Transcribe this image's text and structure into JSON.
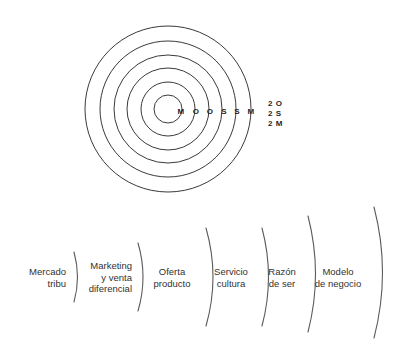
{
  "figure": {
    "background_color": "#ffffff",
    "stroke_color": "#3a3a3a",
    "text_color": "#33312f"
  },
  "rings": {
    "count": 6,
    "center": {
      "x": 168,
      "y": 109
    },
    "radii": [
      14,
      27,
      41,
      54,
      68,
      83
    ],
    "letters": [
      {
        "label": "M",
        "x": 181,
        "y": 111
      },
      {
        "label": "O",
        "x": 196,
        "y": 111
      },
      {
        "label": "O",
        "x": 210,
        "y": 111
      },
      {
        "label": "S",
        "x": 224,
        "y": 111
      },
      {
        "label": "S",
        "x": 237,
        "y": 111
      },
      {
        "label": "M",
        "x": 251,
        "y": 111
      }
    ]
  },
  "legend": {
    "x": 268,
    "y": 99,
    "lines": [
      "2 O",
      "2 S",
      "2 M"
    ]
  },
  "segments": [
    {
      "name": "mercado-tribu",
      "label": "Mercado\ntribu",
      "align": "right",
      "text_x": 8,
      "text_width": 58,
      "text_y": 277,
      "arc": {
        "x": 74,
        "y_top": 252,
        "y_bottom": 302,
        "bulge": 7
      }
    },
    {
      "name": "marketing-venta-diferencial",
      "label": "Marketing\ny venta\ndiferencial",
      "align": "right",
      "text_x": 74,
      "text_width": 58,
      "text_y": 277,
      "arc": {
        "x": 138,
        "y_top": 243,
        "y_bottom": 311,
        "bulge": 10
      }
    },
    {
      "name": "oferta-producto",
      "label": "Oferta\nproducto",
      "align": "center",
      "text_x": 143,
      "text_width": 58,
      "text_y": 277,
      "arc": {
        "x": 206,
        "y_top": 228,
        "y_bottom": 326,
        "bulge": 14
      }
    },
    {
      "name": "servicio-cultura",
      "label": "Servicio\ncultura",
      "align": "center",
      "text_x": 205,
      "text_width": 52,
      "text_y": 277,
      "arc": {
        "x": 262,
        "y_top": 228,
        "y_bottom": 326,
        "bulge": 13
      }
    },
    {
      "name": "razon-de-ser",
      "label": "Razón\nde ser",
      "align": "center",
      "text_x": 259,
      "text_width": 46,
      "text_y": 277,
      "arc": {
        "x": 308,
        "y_top": 216,
        "y_bottom": 332,
        "bulge": 15
      }
    },
    {
      "name": "modelo-de-negocio",
      "label": "Modelo\nde negocio",
      "align": "center",
      "text_x": 306,
      "text_width": 64,
      "text_y": 277,
      "arc": {
        "x": 374,
        "y_top": 207,
        "y_bottom": 338,
        "bulge": 17
      }
    }
  ]
}
